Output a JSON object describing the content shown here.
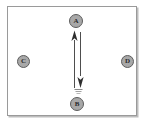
{
  "diagram": {
    "frame": {
      "name": "diagram-frame",
      "border_color": "#9a9a9a",
      "shadow_color": "#bdbdbd",
      "background": "#ffffff"
    },
    "node_style": {
      "fill": "#a8a8a8",
      "stroke": "#5d5d5d",
      "label_color": "#2a2a2a"
    },
    "nodes": [
      {
        "id": "A",
        "label": "A",
        "position": "top-center"
      },
      {
        "id": "B",
        "label": "B",
        "position": "bottom-center"
      },
      {
        "id": "C",
        "label": "C",
        "position": "left-middle"
      },
      {
        "id": "D",
        "label": "D",
        "position": "right-middle"
      }
    ],
    "edges": [
      {
        "id": "edge-b-to-a",
        "from": "B",
        "to": "A",
        "direction": "up",
        "arrowhead": "at-A",
        "color": "#3a3a3a"
      },
      {
        "id": "edge-a-to-b",
        "from": "A",
        "to": "B",
        "direction": "down",
        "arrowhead": "at-B",
        "color": "#3a3a3a"
      }
    ]
  }
}
